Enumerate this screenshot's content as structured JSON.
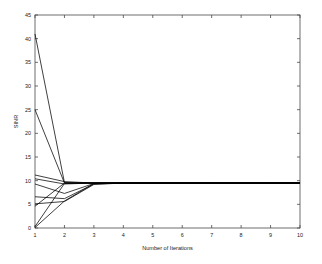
{
  "chart_data": {
    "type": "line",
    "title": "",
    "xlabel": "Number of Iterations",
    "ylabel": "SINR",
    "xlim": [
      1,
      10
    ],
    "ylim": [
      0,
      45
    ],
    "xticks": [
      1,
      2,
      3,
      4,
      5,
      6,
      7,
      8,
      9,
      10
    ],
    "yticks": [
      0,
      5,
      10,
      15,
      20,
      25,
      30,
      35,
      40,
      45
    ],
    "grid": false,
    "legend": null,
    "legend_position": "none",
    "x": [
      1,
      2,
      3,
      4,
      5,
      6,
      7,
      8,
      9,
      10
    ],
    "series": [
      {
        "name": "user-1",
        "values": [
          41.0,
          9.6,
          9.5,
          9.5,
          9.5,
          9.5,
          9.5,
          9.5,
          9.5,
          9.5
        ]
      },
      {
        "name": "user-2",
        "values": [
          25.0,
          9.5,
          9.5,
          9.5,
          9.5,
          9.5,
          9.5,
          9.5,
          9.5,
          9.5
        ]
      },
      {
        "name": "user-3",
        "values": [
          11.2,
          9.8,
          9.5,
          9.5,
          9.5,
          9.5,
          9.5,
          9.5,
          9.5,
          9.5
        ]
      },
      {
        "name": "user-4",
        "values": [
          10.4,
          9.3,
          9.5,
          9.5,
          9.5,
          9.5,
          9.5,
          9.5,
          9.5,
          9.5
        ]
      },
      {
        "name": "user-5",
        "values": [
          9.3,
          7.3,
          9.4,
          9.5,
          9.5,
          9.5,
          9.5,
          9.5,
          9.5,
          9.5
        ]
      },
      {
        "name": "user-6",
        "values": [
          6.6,
          6.2,
          9.3,
          9.5,
          9.5,
          9.5,
          9.5,
          9.5,
          9.5,
          9.5
        ]
      },
      {
        "name": "user-7",
        "values": [
          5.1,
          5.6,
          9.2,
          9.5,
          9.5,
          9.5,
          9.5,
          9.5,
          9.5,
          9.5
        ]
      },
      {
        "name": "user-8",
        "values": [
          4.6,
          9.5,
          9.5,
          9.5,
          9.5,
          9.5,
          9.5,
          9.5,
          9.5,
          9.5
        ]
      },
      {
        "name": "user-9",
        "values": [
          0.3,
          9.4,
          9.5,
          9.5,
          9.5,
          9.5,
          9.5,
          9.5,
          9.5,
          9.5
        ]
      },
      {
        "name": "user-10",
        "values": [
          0.1,
          5.7,
          9.4,
          9.5,
          9.5,
          9.5,
          9.5,
          9.5,
          9.5,
          9.5
        ]
      }
    ]
  },
  "axis": {
    "xlabel": "Number of Iterations",
    "ylabel": "SINR"
  }
}
